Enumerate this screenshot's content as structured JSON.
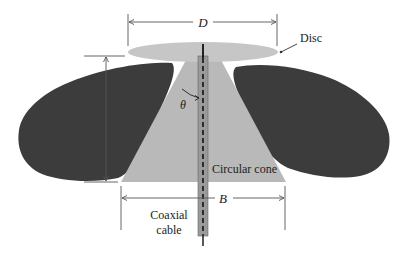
{
  "diagram": {
    "labels": {
      "D": "D",
      "disc": "Disc",
      "theta": "θ",
      "cone": "Circular cone",
      "B": "B",
      "coax_line1": "Coaxial",
      "coax_line2": "cable"
    },
    "components": [
      {
        "name": "disc",
        "shape": "ellipse",
        "color": "#c4c4c4"
      },
      {
        "name": "circular-cone",
        "shape": "trapezoid",
        "color": "#b8b8b8"
      },
      {
        "name": "coaxial-cable",
        "shape": "vertical-rod",
        "color": "#a0a0a0"
      },
      {
        "name": "left-radiation-lobe",
        "shape": "blob",
        "color": "#3c3c3c"
      },
      {
        "name": "right-radiation-lobe",
        "shape": "blob",
        "color": "#3c3c3c"
      }
    ],
    "dimensions": [
      {
        "name": "disc-diameter",
        "symbol": "D"
      },
      {
        "name": "cone-base-diameter",
        "symbol": "B"
      },
      {
        "name": "cone-height",
        "symbol": ""
      },
      {
        "name": "cone-half-angle",
        "symbol": "θ"
      }
    ],
    "colors": {
      "lobe": "#3c3c3c",
      "disc": "#c6c6c6",
      "cone": "#b9b9b9",
      "cable": "#9a9a9a",
      "line": "#555555"
    }
  }
}
